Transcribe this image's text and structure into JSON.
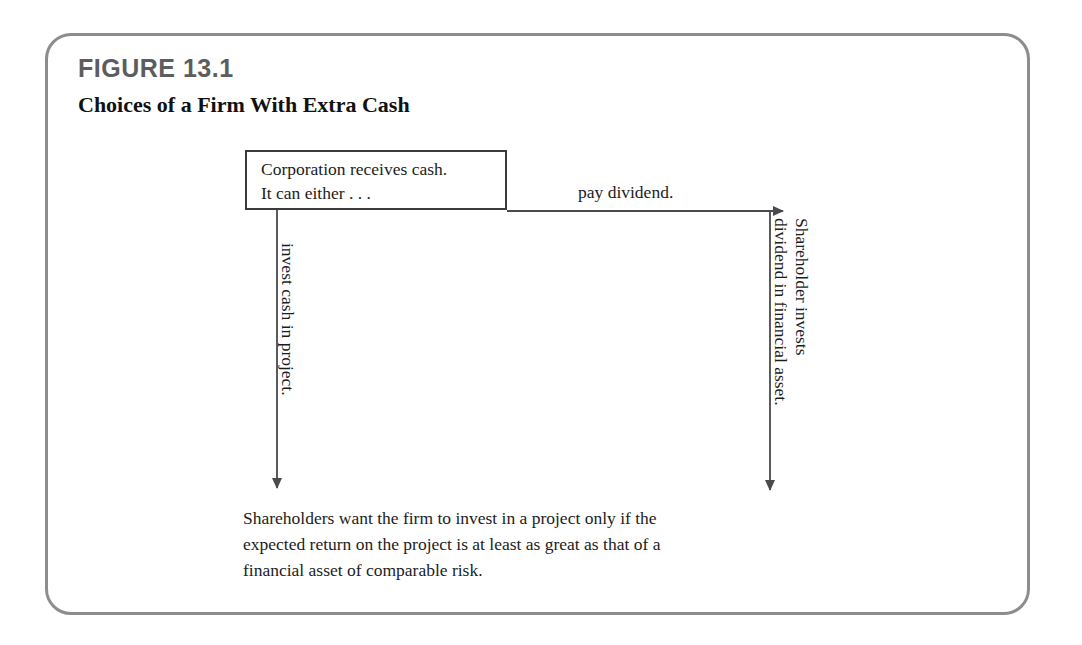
{
  "figure": {
    "number": "FIGURE 13.1",
    "title": "Choices of a Firm With Extra Cash"
  },
  "diagram": {
    "source_box": {
      "text": "Corporation receives cash.\nIt can either . . ."
    },
    "edges": [
      {
        "id": "pay-dividend",
        "label": "pay dividend.",
        "direction": "right"
      },
      {
        "id": "invest-cash",
        "label": "invest cash in project.",
        "direction": "down"
      },
      {
        "id": "shareholder-invests",
        "label": "Shareholder invests\ndividend in financial asset.",
        "direction": "down"
      }
    ],
    "caption": "Shareholders want the firm to invest in a project only if the\nexpected return on the project is at least as great as that of a\nfinancial asset of comparable risk."
  },
  "colors": {
    "frame_border": "#8d8d8d",
    "box_border": "#3b3b3b",
    "arrow": "#4a4a4a",
    "figure_number": "#5d5d5d",
    "text": "#1c1c1c",
    "background": "#ffffff"
  }
}
